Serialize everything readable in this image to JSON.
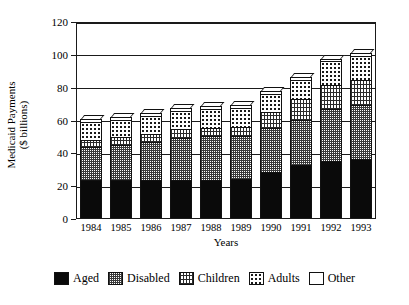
{
  "chart_data": {
    "type": "bar",
    "stacked": true,
    "title": "",
    "xlabel": "Years",
    "ylabel": "Medicaid Payments ($ billions)",
    "ylabel_line1": "Medicaid Payments",
    "ylabel_line2": "($ billions)",
    "categories": [
      "1984",
      "1985",
      "1986",
      "1987",
      "1988",
      "1989",
      "1990",
      "1991",
      "1992",
      "1993"
    ],
    "ylim": [
      0,
      120
    ],
    "yticks": [
      0,
      20,
      40,
      60,
      80,
      100,
      120
    ],
    "ytick_labels": [
      "0",
      "20",
      "40",
      "60",
      "80",
      "100",
      "120"
    ],
    "grid": true,
    "legend_position": "bottom",
    "series": [
      {
        "name": "Aged",
        "pattern": "solid-black",
        "values": [
          23.0,
          23.0,
          23.3,
          23.3,
          23.3,
          23.8,
          28.0,
          32.0,
          34.8,
          36.0
        ]
      },
      {
        "name": "Disabled",
        "pattern": "dense-checker",
        "values": [
          20.5,
          21.5,
          23.2,
          25.7,
          26.5,
          26.2,
          27.0,
          27.5,
          31.5,
          33.0
        ]
      },
      {
        "name": "Children",
        "pattern": "vertical-hatch",
        "values": [
          4.2,
          4.6,
          4.8,
          5.0,
          5.3,
          5.5,
          9.5,
          12.8,
          15.0,
          14.8
        ]
      },
      {
        "name": "Adults",
        "pattern": "sparse-dots",
        "values": [
          10.6,
          10.6,
          10.9,
          11.0,
          11.4,
          11.5,
          11.0,
          12.0,
          14.5,
          15.0
        ]
      },
      {
        "name": "Other",
        "pattern": "white",
        "values": [
          2.2,
          1.8,
          2.0,
          1.8,
          1.7,
          2.0,
          1.9,
          1.8,
          1.2,
          1.6
        ]
      }
    ],
    "totals": [
      60.5,
      61.5,
      64.2,
      66.8,
      68.2,
      69.0,
      77.4,
      86.1,
      97.0,
      100.4
    ]
  },
  "legend": {
    "items": [
      {
        "label": "Aged"
      },
      {
        "label": "Disabled"
      },
      {
        "label": "Children"
      },
      {
        "label": "Adults"
      },
      {
        "label": "Other"
      }
    ]
  }
}
